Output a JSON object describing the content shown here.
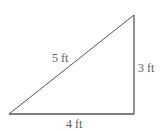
{
  "diagram": {
    "type": "right-triangle",
    "vertices": {
      "bottom_left": [
        9,
        114
      ],
      "bottom_right": [
        134,
        114
      ],
      "top_right": [
        134,
        15
      ]
    },
    "sides": {
      "hypotenuse": {
        "label": "5 ft",
        "length": 5,
        "unit": "ft"
      },
      "vertical": {
        "label": "3 ft",
        "length": 3,
        "unit": "ft"
      },
      "base": {
        "label": "4 ft",
        "length": 4,
        "unit": "ft"
      }
    },
    "colors": {
      "line": "#555555",
      "text": "#5a5a5a",
      "background": "#ffffff"
    }
  }
}
